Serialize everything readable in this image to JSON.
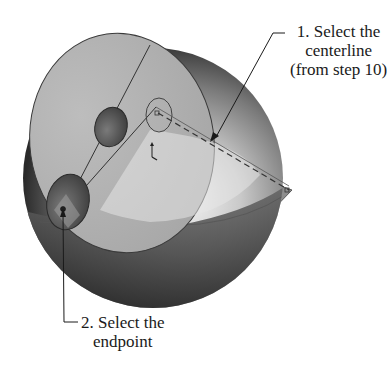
{
  "figure": {
    "type": "cad-instruction-illustration",
    "colors": {
      "background": "#ffffff",
      "sphere_light": "#f2f2f2",
      "sphere_mid": "#9a9a9a",
      "sphere_dark": "#2b2b2b",
      "plane": "#8c8c8c",
      "line": "#333333",
      "text": "#1a1a1a"
    }
  },
  "callouts": [
    {
      "id": 1,
      "lines": [
        "1. Select the",
        "centerline",
        "(from step 10)"
      ],
      "target": "centerline"
    },
    {
      "id": 2,
      "lines": [
        "2. Select the",
        "endpoint"
      ],
      "target": "endpoint"
    }
  ]
}
